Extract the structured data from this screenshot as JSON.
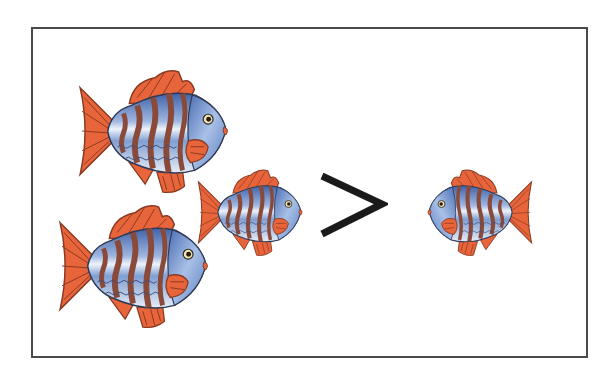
{
  "illustration": {
    "caption": "Comparison: 3 fish > 1 fish",
    "left_group": {
      "count": 3,
      "label": "three fish"
    },
    "operator": {
      "symbol": ">",
      "meaning": "greater than"
    },
    "right_group": {
      "count": 1,
      "label": "one fish"
    }
  },
  "colors": {
    "frame": "#4a4a4a",
    "fin": "#e8643a",
    "fin_line": "#8a3a22",
    "body_blue": "#5b7fc0",
    "body_light": "#dfe8f5",
    "stripe": "#8a4a3a",
    "operator": "#1a1a1a"
  },
  "fish": [
    {
      "id": "fish-top-left",
      "x": 72,
      "y": 68,
      "w": 160,
      "h": 128,
      "dir": "right"
    },
    {
      "id": "fish-bottom-left",
      "x": 52,
      "y": 203,
      "w": 160,
      "h": 128,
      "dir": "right"
    },
    {
      "id": "fish-middle",
      "x": 186,
      "y": 168,
      "w": 128,
      "h": 88,
      "dir": "right"
    },
    {
      "id": "fish-right",
      "x": 418,
      "y": 168,
      "w": 128,
      "h": 88,
      "dir": "left"
    }
  ]
}
